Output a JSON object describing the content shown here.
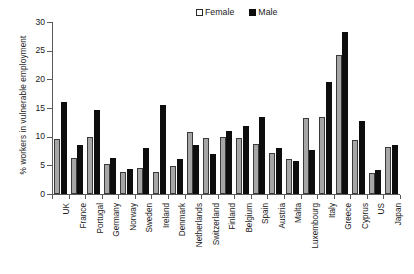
{
  "chart_data": {
    "type": "bar",
    "title": "",
    "subtitle": "",
    "xlabel": "",
    "ylabel": "% workers in vulnerable employment",
    "ylim": [
      0,
      30
    ],
    "yticks": [
      0,
      5,
      10,
      15,
      20,
      25,
      30
    ],
    "grid": false,
    "legend_position": "top-right",
    "categories": [
      "UK",
      "France",
      "Portugal",
      "Germany",
      "Norway",
      "Sweden",
      "Ireland",
      "Denmark",
      "Netherlands",
      "Switzerland",
      "Finland",
      "Belgium",
      "Spain",
      "Austria",
      "Malta",
      "Luxembourg",
      "Italy",
      "Greece",
      "Cyprus",
      "US",
      "Japan"
    ],
    "series": [
      {
        "name": "Female",
        "color": "#a6a6a6",
        "values": [
          9.6,
          6.3,
          9.9,
          5.2,
          3.9,
          4.6,
          3.8,
          4.8,
          10.9,
          9.7,
          10.0,
          9.7,
          8.8,
          7.1,
          6.1,
          13.3,
          13.4,
          24.2,
          9.5,
          3.6,
          8.2
        ]
      },
      {
        "name": "Male",
        "color": "#0d0d0d",
        "values": [
          16.0,
          8.6,
          14.6,
          6.3,
          4.4,
          8.1,
          15.5,
          6.1,
          8.5,
          7.0,
          11.0,
          11.9,
          13.4,
          8.0,
          5.7,
          7.7,
          19.6,
          28.2,
          12.7,
          4.2,
          8.6
        ]
      }
    ]
  },
  "legend": {
    "items": [
      {
        "label": "Female",
        "swatch": "female-swatch"
      },
      {
        "label": "Male",
        "swatch": "male-swatch"
      }
    ]
  }
}
